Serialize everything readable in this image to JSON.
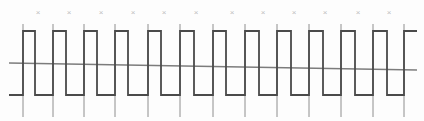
{
  "figure": {
    "title": "",
    "type": "digital-square-wave-timing-diagram",
    "width": 424,
    "height": 121,
    "background_color": "#fdfdfd"
  },
  "colors": {
    "waveform": "#4a4a4a",
    "gridline": "#8e8e8e",
    "axis": "#7c7c7c",
    "tick_mark": "#bdbdbd",
    "background": "#fdfdfd"
  },
  "axis": {
    "name": "baseline-axis",
    "x_start": 9,
    "y_start": 63,
    "x_end": 417,
    "y_end": 70,
    "stroke_width": 1.3
  },
  "tick_marks": {
    "glyph": "×",
    "count": 12,
    "y": 13,
    "x_positions": [
      38,
      69,
      101,
      133,
      164,
      196,
      232,
      263,
      294,
      325,
      358,
      389
    ]
  },
  "gridlines": {
    "count": 12,
    "y_top": 24,
    "y_bottom": 117,
    "stroke_width": 1.0,
    "x_positions": [
      23,
      53,
      84,
      115,
      148,
      180,
      213,
      245,
      277,
      309,
      341,
      373,
      404
    ]
  },
  "chart_data": {
    "type": "line",
    "title": "",
    "xlabel": "",
    "ylabel": "",
    "series": [
      {
        "name": "square-wave",
        "style": "step",
        "high_level": 31,
        "low_level": 95,
        "start_x": 9,
        "end_x": 417,
        "transitions": [
          {
            "x": 23,
            "edge": "rising"
          },
          {
            "x": 35,
            "edge": "falling"
          },
          {
            "x": 53,
            "edge": "rising"
          },
          {
            "x": 66,
            "edge": "falling"
          },
          {
            "x": 84,
            "edge": "rising"
          },
          {
            "x": 97,
            "edge": "falling"
          },
          {
            "x": 115,
            "edge": "rising"
          },
          {
            "x": 128,
            "edge": "falling"
          },
          {
            "x": 148,
            "edge": "rising"
          },
          {
            "x": 161,
            "edge": "falling"
          },
          {
            "x": 180,
            "edge": "rising"
          },
          {
            "x": 194,
            "edge": "falling"
          },
          {
            "x": 213,
            "edge": "rising"
          },
          {
            "x": 226,
            "edge": "falling"
          },
          {
            "x": 245,
            "edge": "rising"
          },
          {
            "x": 259,
            "edge": "falling"
          },
          {
            "x": 277,
            "edge": "rising"
          },
          {
            "x": 291,
            "edge": "falling"
          },
          {
            "x": 309,
            "edge": "rising"
          },
          {
            "x": 323,
            "edge": "falling"
          },
          {
            "x": 341,
            "edge": "rising"
          },
          {
            "x": 355,
            "edge": "falling"
          },
          {
            "x": 373,
            "edge": "rising"
          },
          {
            "x": 387,
            "edge": "falling"
          },
          {
            "x": 404,
            "edge": "rising"
          }
        ]
      }
    ],
    "ylim": [
      121,
      0
    ],
    "xlim": [
      0,
      424
    ],
    "grid": true,
    "legend": "none"
  }
}
